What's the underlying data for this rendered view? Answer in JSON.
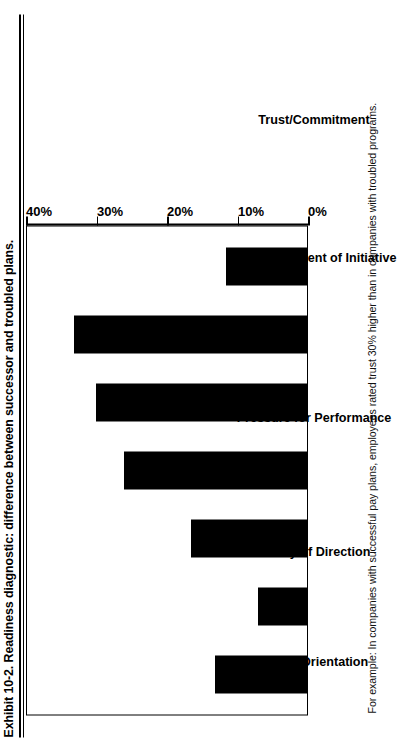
{
  "exhibit": {
    "title": "Exhibit 10-2.  Readiness diagnostic: difference between successor and troubled plans.",
    "caption": "For example: In companies with successful pay plans, employees rated trust 30% higher than in companies with troubled programs."
  },
  "chart_data": {
    "type": "bar",
    "title": "Exhibit 10-2.  Readiness diagnostic: difference between successor and troubled plans.",
    "xlabel": "",
    "ylabel": "",
    "ylim": [
      0,
      40
    ],
    "grid": false,
    "legend": null,
    "tick_labels": [
      "0%",
      "10%",
      "20%",
      "30%",
      "40%"
    ],
    "tick_values": [
      0,
      10,
      20,
      30,
      40
    ],
    "categories": [
      "Group Orientation",
      "Clarity of Direction",
      "Pressure for Performance",
      "Encouragement of Initiative",
      "Trust/Commitment",
      "Performance Measurement",
      "Compensation"
    ],
    "values": [
      13,
      7,
      16.5,
      26,
      30,
      33,
      11.5
    ],
    "bar_color": "#000000",
    "orientation": "vertical"
  }
}
